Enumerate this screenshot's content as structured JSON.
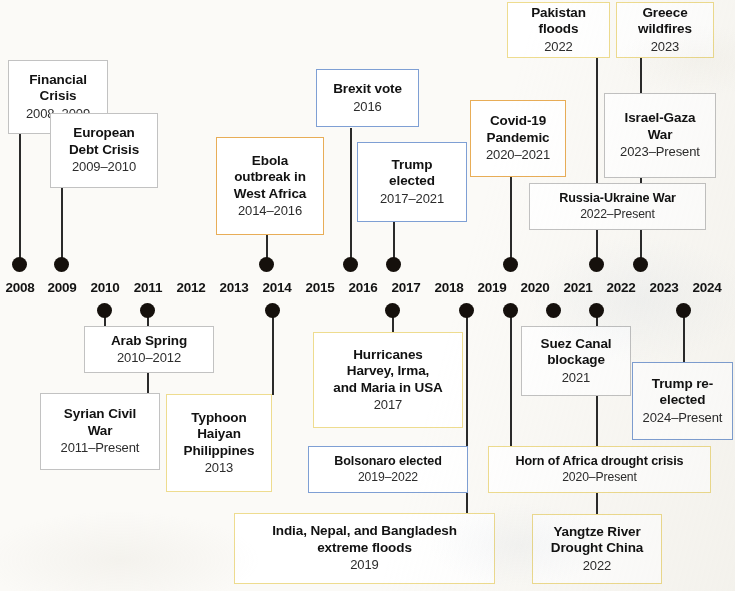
{
  "figure": {
    "type": "timeline",
    "axis_start_year": 2008,
    "axis_end_year": 2024
  },
  "axis": {
    "years": [
      "2008",
      "2009",
      "2010",
      "2011",
      "2012",
      "2013",
      "2014",
      "2015",
      "2016",
      "2017",
      "2018",
      "2019",
      "2020",
      "2021",
      "2022",
      "2023",
      "2024"
    ],
    "markers_above": [
      "2008",
      "2009",
      "2014",
      "2016",
      "2017",
      "2020",
      "2022",
      "2023"
    ],
    "markers_below": [
      "2010",
      "2011",
      "2013",
      "2017",
      "2019",
      "2020",
      "2021",
      "2022",
      "2024"
    ],
    "dot_color": "#15100c"
  },
  "palette": {
    "gray": "#c2c2c2",
    "blue": "#7e9fd4",
    "yellow": "#eedc8f",
    "orange": "#e8ad57",
    "box_fill": "#ffffff",
    "connector": "#2a2a2a",
    "background": "#fbfaf7",
    "text": "#121212"
  },
  "events_above": [
    {
      "id": "financial-crisis",
      "title": "Financial\nCrisis",
      "date": "2008–2009",
      "color": "gray",
      "year": "2008"
    },
    {
      "id": "european-debt",
      "title": "European\nDebt Crisis",
      "date": "2009–2010",
      "color": "gray",
      "year": "2009"
    },
    {
      "id": "ebola",
      "title": "Ebola\noutbreak in\nWest Africa",
      "date": "2014–2016",
      "color": "orange",
      "year": "2014"
    },
    {
      "id": "brexit",
      "title": "Brexit vote",
      "date": "2016",
      "color": "blue",
      "year": "2016"
    },
    {
      "id": "trump-elected",
      "title": "Trump\nelected",
      "date": "2017–2021",
      "color": "blue",
      "year": "2017"
    },
    {
      "id": "covid-19",
      "title": "Covid-19\nPandemic",
      "date": "2020–2021",
      "color": "orange",
      "year": "2020"
    },
    {
      "id": "pakistan-floods",
      "title": "Pakistan\nfloods",
      "date": "2022",
      "color": "yellow",
      "year": "2022"
    },
    {
      "id": "russia-ukraine",
      "title": "Russia-Ukraine War",
      "date": "2022–Present",
      "color": "gray",
      "year": "2022"
    },
    {
      "id": "greece-wildfires",
      "title": "Greece\nwildfires",
      "date": "2023",
      "color": "yellow",
      "year": "2023"
    },
    {
      "id": "israel-gaza",
      "title": "Israel-Gaza\nWar",
      "date": "2023–Present",
      "color": "gray",
      "year": "2023"
    }
  ],
  "events_below": [
    {
      "id": "arab-spring",
      "title": "Arab Spring",
      "date": "2010–2012",
      "color": "gray",
      "year": "2010"
    },
    {
      "id": "syrian-civil-war",
      "title": "Syrian Civil\nWar",
      "date": "2011–Present",
      "color": "gray",
      "year": "2011"
    },
    {
      "id": "typhoon-haiyan",
      "title": "Typhoon\nHaiyan\nPhilippines",
      "date": "2013",
      "color": "yellow",
      "year": "2013"
    },
    {
      "id": "hurricanes-usa",
      "title": "Hurricanes\nHarvey, Irma,\nand Maria in USA",
      "date": "2017",
      "color": "yellow",
      "year": "2017"
    },
    {
      "id": "bolsonaro",
      "title": "Bolsonaro elected",
      "date": "2019–2022",
      "color": "blue",
      "year": "2019"
    },
    {
      "id": "india-nepal-floods",
      "title": "India, Nepal, and Bangladesh\nextreme floods",
      "date": "2019",
      "color": "yellow",
      "year": "2019"
    },
    {
      "id": "suez-canal",
      "title": "Suez Canal\nblockage",
      "date": "2021",
      "color": "gray",
      "year": "2021"
    },
    {
      "id": "horn-of-africa",
      "title": "Horn of Africa drought crisis",
      "date": "2020–Present",
      "color": "yellow",
      "year": "2020"
    },
    {
      "id": "yangtze-drought",
      "title": "Yangtze River\nDrought China",
      "date": "2022",
      "color": "yellow",
      "year": "2022"
    },
    {
      "id": "trump-reelected",
      "title": "Trump re-\nelected",
      "date": "2024–Present",
      "color": "blue",
      "year": "2024"
    }
  ]
}
